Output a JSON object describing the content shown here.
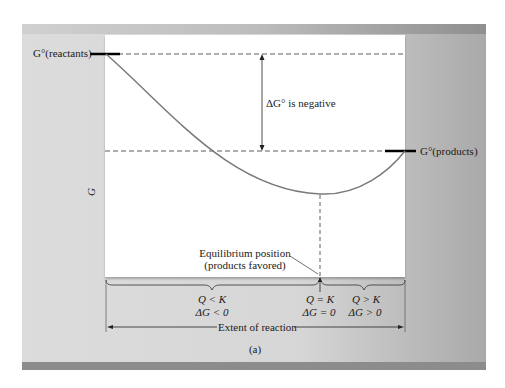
{
  "figure": {
    "caption": "(a)",
    "y_axis_label": "G",
    "x_axis_label": "Extent of reaction",
    "labels": {
      "g_reactants": "G°(reactants)",
      "g_products": "G°(products)",
      "delta_g_standard": "ΔG° is negative",
      "equilibrium_line1": "Equilibrium position",
      "equilibrium_line2": "(products favored)"
    },
    "regions": [
      {
        "condition": "Q < K",
        "delta_g": "ΔG < 0"
      },
      {
        "condition": "Q = K",
        "delta_g": "ΔG = 0"
      },
      {
        "condition": "Q > K",
        "delta_g": "ΔG > 0"
      }
    ],
    "colors": {
      "curve": "#7a7a7a",
      "panel_bg": "#d8d8d8",
      "plot_bg": "#ffffff",
      "band": "#8c8c8c",
      "ink": "#1a1a1a"
    }
  }
}
